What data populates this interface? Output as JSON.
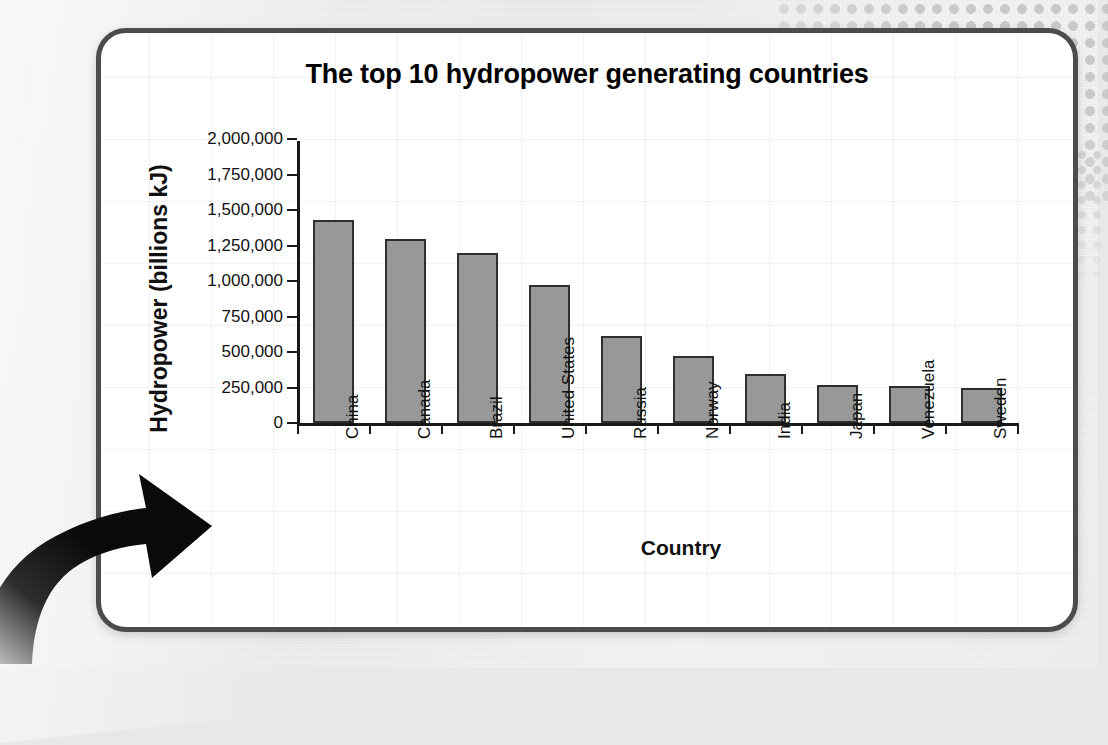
{
  "chart_data": {
    "type": "bar",
    "title": "The top 10 hydropower generating countries",
    "xlabel": "Country",
    "ylabel": "Hydropower (billions kJ)",
    "categories": [
      "China",
      "Canada",
      "Brazil",
      "United States",
      "Russia",
      "Norway",
      "India",
      "Japan",
      "Venezuela",
      "Sweden"
    ],
    "values": [
      1430000,
      1295000,
      1200000,
      970000,
      615000,
      470000,
      345000,
      270000,
      258000,
      245000
    ],
    "ylim": [
      0,
      2000000
    ],
    "ytick_labels": [
      "0",
      "250,000",
      "500,000",
      "750,000",
      "1,000,000",
      "1,250,000",
      "1,500,000",
      "1,750,000",
      "2,000,000"
    ],
    "ytick_values": [
      0,
      250000,
      500000,
      750000,
      1000000,
      1250000,
      1500000,
      1750000,
      2000000
    ],
    "grid": false,
    "legend": "none",
    "bar_color": "#989898",
    "bar_border_color": "#2e2e2e",
    "axis_color": "#1a1a1a"
  },
  "panel": {
    "border_color": "#4c4c4c",
    "background_color": "#ffffff"
  },
  "decoration": {
    "arrow_name": "curved-arrow-pointing-to-chart",
    "arrow_color": "#0a0a0a",
    "dots_color": "#c9c9c9",
    "page_background": "#e8e8e8"
  }
}
